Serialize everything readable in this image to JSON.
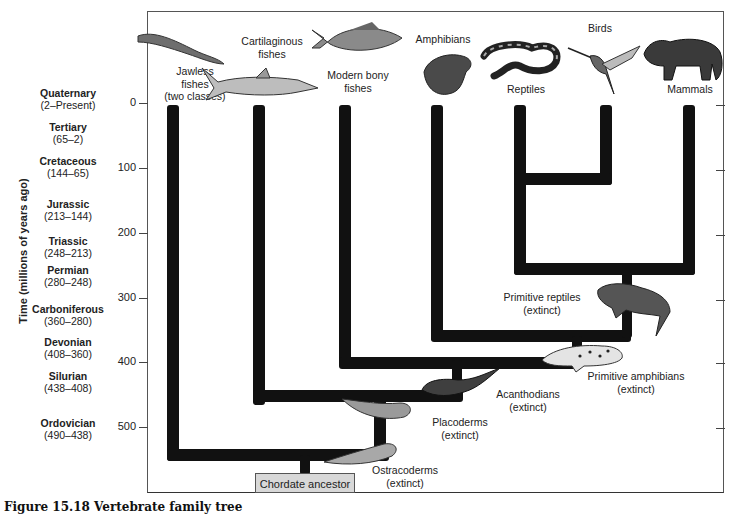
{
  "figure": {
    "caption": "Figure 15.18  Vertebrate family tree",
    "root_label": "Chordate ancestor"
  },
  "axis": {
    "label": "Time (millions of years ago)",
    "ticks": [
      "0",
      "100",
      "200",
      "300",
      "400",
      "500"
    ]
  },
  "periods": [
    {
      "name": "Quaternary",
      "range": "(2–Present)"
    },
    {
      "name": "Tertiary",
      "range": "(65–2)"
    },
    {
      "name": "Cretaceous",
      "range": "(144–65)"
    },
    {
      "name": "Jurassic",
      "range": "(213–144)"
    },
    {
      "name": "Triassic",
      "range": "(248–213)"
    },
    {
      "name": "Permian",
      "range": "(280–248)"
    },
    {
      "name": "Carboniferous",
      "range": "(360–280)"
    },
    {
      "name": "Devonian",
      "range": "(408–360)"
    },
    {
      "name": "Silurian",
      "range": "(438–408)"
    },
    {
      "name": "Ordovician",
      "range": "(490–438)"
    }
  ],
  "living_groups": [
    {
      "line1": "Jawless",
      "line2": "fishes",
      "line3": "(two classes)"
    },
    {
      "line1": "Cartilaginous",
      "line2": "fishes"
    },
    {
      "line1": "Modern bony",
      "line2": "fishes"
    },
    {
      "line1": "Amphibians"
    },
    {
      "line1": "Reptiles"
    },
    {
      "line1": "Birds"
    },
    {
      "line1": "Mammals"
    }
  ],
  "extinct_groups": [
    {
      "name": "Ostracoderms",
      "note": "(extinct)"
    },
    {
      "name": "Placoderms",
      "note": "(extinct)"
    },
    {
      "name": "Acanthodians",
      "note": "(extinct)"
    },
    {
      "name": "Primitive amphibians",
      "note": "(extinct)"
    },
    {
      "name": "Primitive reptiles",
      "note": "(extinct)"
    }
  ],
  "colors": {
    "branch": "#111111",
    "box": "#d8d8d8",
    "frame": "#555555"
  }
}
